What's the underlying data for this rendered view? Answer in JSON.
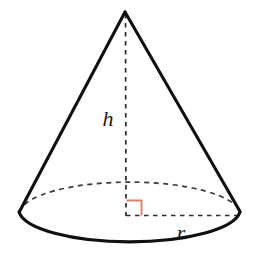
{
  "figure": {
    "name": "cone-diagram",
    "type": "geometric-solid",
    "shape": "right circular cone",
    "background_color": "#ffffff",
    "width": 259,
    "height": 264
  },
  "colors": {
    "outline": "#101010",
    "hidden_edge": "#3a3a3a",
    "measure_line": "#2c2c2c",
    "right_angle_marker": "#d9826b",
    "label_text": "#1c1c1c",
    "background": "#ffffff"
  },
  "labels": {
    "height": "h",
    "radius": "r"
  },
  "geometry": {
    "apex": {
      "x": 125,
      "y": 12
    },
    "base_center": {
      "x": 126,
      "y": 215
    },
    "base_rx": 111,
    "base_ry": 33,
    "left_base_point": {
      "x": 19,
      "y": 212
    },
    "right_base_point": {
      "x": 240,
      "y": 212
    },
    "radius_end": {
      "x": 237,
      "y": 215
    },
    "height_label_pos": {
      "x": 108,
      "y": 120
    },
    "radius_label_pos": {
      "x": 181,
      "y": 234
    },
    "right_angle_size": 15
  },
  "elements": {
    "apex_point": "apex",
    "left_slant": "left slant edge",
    "right_slant": "right slant edge",
    "base_front_arc": "solid front arc of base ellipse",
    "base_back_arc": "dashed hidden back arc of base ellipse",
    "height_segment": "dashed vertical height from apex to base center",
    "radius_segment": "dashed horizontal radius from base center to rim",
    "right_angle": "right angle marker between height and radius"
  }
}
